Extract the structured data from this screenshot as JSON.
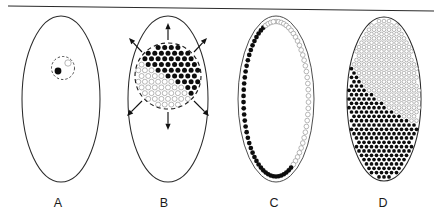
{
  "figure": {
    "type": "scientific-diagram",
    "width": 440,
    "height": 222,
    "background_color": "#ffffff",
    "top_rule": {
      "present": true,
      "x1": 8,
      "y1": 6,
      "x2": 434,
      "y2": 11,
      "color": "#2a2a2a"
    },
    "colors": {
      "outline": "#2b2b2b",
      "filled_dot": "#0d0d0d",
      "open_dot_stroke": "#8a8a8a",
      "open_dot_fill": "#ffffff",
      "arrow": "#111111",
      "label_text": "#1a1a1a"
    },
    "panels": [
      {
        "id": "A",
        "label": "A",
        "label_x": 58,
        "label_y": 207,
        "ellipse": {
          "cx": 61,
          "cy": 99,
          "rx": 39,
          "ry": 83
        },
        "stage_name": "initiation",
        "inner_cluster": {
          "dashed_circle": {
            "cx": 63,
            "cy": 68,
            "r": 11.5
          },
          "dots": [
            {
              "type": "filled",
              "cx": 58,
              "cy": 71,
              "r": 3.4
            },
            {
              "type": "open",
              "cx": 68,
              "cy": 63,
              "r": 3.2
            }
          ]
        },
        "arrows": []
      },
      {
        "id": "B",
        "label": "B",
        "label_x": 164,
        "label_y": 207,
        "ellipse": {
          "cx": 168,
          "cy": 99,
          "rx": 40,
          "ry": 83
        },
        "stage_name": "expansion",
        "cluster": {
          "dashed_circle": {
            "cx": 168,
            "cy": 76,
            "r": 33
          },
          "packing": "hexagonal",
          "dot_radius": 2.5,
          "spacing": 6.6,
          "divide_line": {
            "description": "diagonal boundary, filled lower-left, open upper-right",
            "x1": 135,
            "y1": 56,
            "x2": 201,
            "y2": 100
          }
        },
        "arrows": [
          {
            "angle_deg": 90,
            "x1": 168,
            "y1": 40,
            "x2": 168,
            "y2": 23
          },
          {
            "angle_deg": 45,
            "x1": 194,
            "y1": 52,
            "x2": 207,
            "y2": 38
          },
          {
            "angle_deg": 135,
            "x1": 142,
            "y1": 52,
            "x2": 129,
            "y2": 38
          },
          {
            "angle_deg": 315,
            "x1": 194,
            "y1": 101,
            "x2": 209,
            "y2": 116
          },
          {
            "angle_deg": 225,
            "x1": 142,
            "y1": 101,
            "x2": 127,
            "y2": 116
          },
          {
            "angle_deg": 270,
            "x1": 168,
            "y1": 112,
            "x2": 168,
            "y2": 130
          }
        ]
      },
      {
        "id": "C",
        "label": "C",
        "label_x": 274,
        "label_y": 207,
        "ellipse": {
          "cx": 276,
          "cy": 99,
          "rx": 38,
          "ry": 83
        },
        "stage_name": "cortical ring",
        "ring": {
          "inset": 5.5,
          "dot_count": 78,
          "dot_radius": 2.35,
          "filled_arc_description": "lower-left arc filled, upper-right arc open",
          "transition_angle_deg_1": 150,
          "transition_angle_deg_2": 340
        }
      },
      {
        "id": "D",
        "label": "D",
        "label_x": 383,
        "label_y": 207,
        "ellipse": {
          "cx": 384,
          "cy": 99,
          "rx": 37,
          "ry": 82
        },
        "stage_name": "full pattern",
        "fill": {
          "packing": "hexagonal",
          "dot_radius": 1.85,
          "spacing": 5.0,
          "boundary": {
            "description": "curved diagonal separating filled lower-left region from open upper-right region",
            "start": {
              "x": 349,
              "y": 60
            },
            "control": {
              "x": 372,
              "y": 108
            },
            "end": {
              "x": 421,
              "y": 126
            }
          }
        }
      }
    ]
  }
}
